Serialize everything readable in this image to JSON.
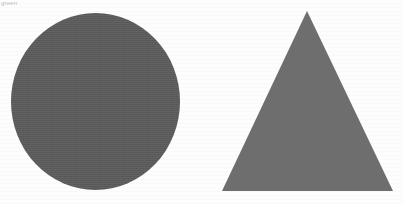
{
  "image": {
    "width": 403,
    "height": 204,
    "background_color": "#fdfdfd",
    "appearance": "scanned-page"
  },
  "caption": {
    "text": "green",
    "color": "#b9b9b9"
  },
  "shapes": [
    {
      "name": "circle",
      "label": "circle",
      "fill_color": "#5a5a5a",
      "center_x": 95,
      "center_y": 101,
      "width": 169,
      "height": 177
    },
    {
      "name": "triangle",
      "label": "triangle",
      "fill_color": "#6e6e6e",
      "points": "307,11 393,191 222,191",
      "apex_x": 307,
      "apex_y": 11,
      "base_left_x": 222,
      "base_right_x": 393,
      "base_y": 191
    }
  ]
}
